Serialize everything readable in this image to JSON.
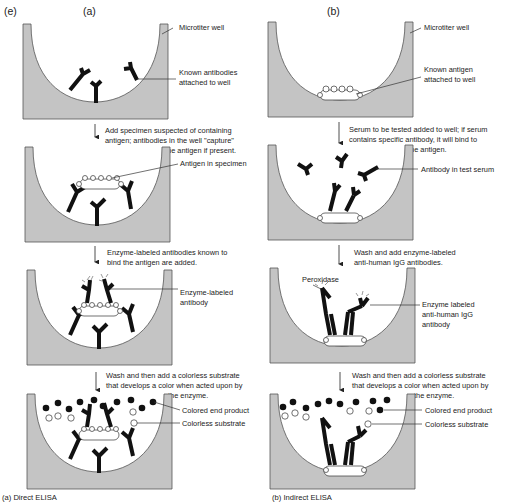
{
  "figure": {
    "panel_letter": "(e)",
    "columns": [
      {
        "id": "direct",
        "header": "(a)",
        "caption": "(a) Direct ELISA",
        "wells": [
          {
            "labels": [
              "Microtiter well",
              "Known antibodies",
              "attached to well"
            ]
          },
          {
            "step": [
              "Add specimen suspected of containing",
              "antigen; antibodies in the well \"capture\"",
              "the antigen if present."
            ],
            "labels": [
              "Antigen in specimen"
            ]
          },
          {
            "step": [
              "Enzyme-labeled antibodies known to",
              "bind the antigen are added."
            ],
            "labels": [
              "Enzyme-labeled",
              "antibody"
            ]
          },
          {
            "step": [
              "Wash and then add a colorless substrate",
              "that develops a color when acted upon by",
              "the enzyme."
            ],
            "labels": [
              "Colored end product",
              "Colorless substrate"
            ]
          }
        ]
      },
      {
        "id": "indirect",
        "header": "(b)",
        "caption": "(b) Indirect ELISA",
        "wells": [
          {
            "labels": [
              "Microtiter well",
              "Known antigen",
              "attached to well"
            ]
          },
          {
            "step": [
              "Serum to be tested added to well; if serum",
              "contains specific antibody, it will bind to",
              "the antigen."
            ],
            "labels": [
              "Antibody in test serum"
            ]
          },
          {
            "step": [
              "Wash and add enzyme-labeled",
              "anti-human IgG antibodies."
            ],
            "labels": [
              "Peroxidase",
              "Enzyme labeled",
              "anti-human IgG",
              "antibody"
            ]
          },
          {
            "step": [
              "Wash and then add a colorless substrate",
              "that develops a color when acted upon by",
              "the enzyme."
            ],
            "labels": [
              "Colored end product",
              "Colorless substrate"
            ]
          }
        ]
      }
    ]
  },
  "colors": {
    "well_fill": "#c4c4c4",
    "antibody": "#111111",
    "background": "#ffffff"
  }
}
